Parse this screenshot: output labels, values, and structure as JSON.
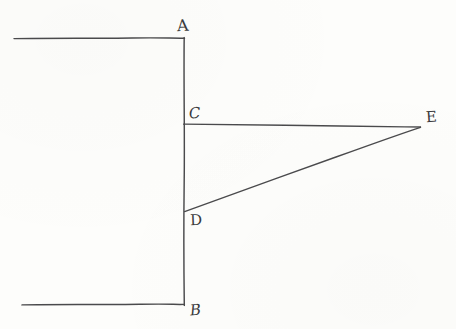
{
  "figure": {
    "kind": "hand-drawn-geometry-diagram",
    "background_color": "#fdfdfb",
    "ink_color": "#4a4a4c",
    "canvas": {
      "width": 456,
      "height": 329
    },
    "points": {
      "A": {
        "label": "A",
        "x": 184,
        "y": 38,
        "label_x": 177,
        "label_y": 18
      },
      "B": {
        "label": "B",
        "x": 184,
        "y": 304,
        "label_x": 190,
        "label_y": 303
      },
      "C": {
        "label": "C",
        "x": 184,
        "y": 124,
        "label_x": 189,
        "label_y": 106
      },
      "D": {
        "label": "D",
        "x": 185,
        "y": 211,
        "label_x": 190,
        "label_y": 213
      },
      "E": {
        "label": "E",
        "x": 420,
        "y": 127,
        "label_x": 426,
        "label_y": 110
      }
    },
    "segments": [
      {
        "name": "top-arm",
        "from": "left-edge-top",
        "to": "A",
        "x1": 14,
        "y1": 38,
        "x2": 184,
        "y2": 38
      },
      {
        "name": "vertical-A-B",
        "from": "A",
        "to": "B",
        "x1": 184,
        "y1": 38,
        "x2": 184,
        "y2": 305
      },
      {
        "name": "bottom-arm",
        "from": "left-edge-bottom",
        "to": "B",
        "x1": 22,
        "y1": 304,
        "x2": 184,
        "y2": 304
      },
      {
        "name": "horizontal-C-E",
        "from": "C",
        "to": "E",
        "x1": 184,
        "y1": 124,
        "x2": 420,
        "y2": 127
      },
      {
        "name": "diagonal-D-E",
        "from": "D",
        "to": "E",
        "x1": 185,
        "y1": 211,
        "x2": 420,
        "y2": 127
      }
    ]
  }
}
